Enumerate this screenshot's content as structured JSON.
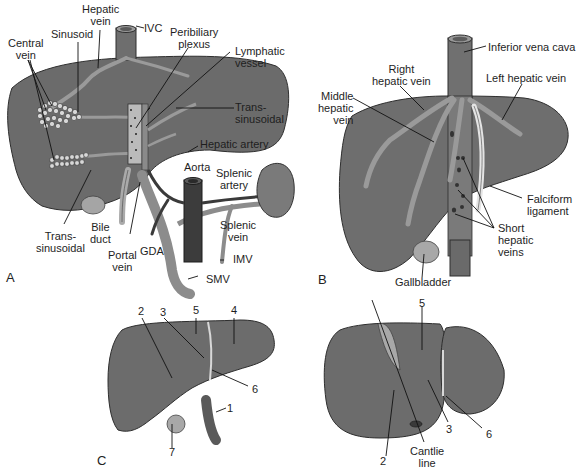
{
  "figure": {
    "panels": [
      {
        "id": "A",
        "letter": "A"
      },
      {
        "id": "B",
        "letter": "B"
      },
      {
        "id": "C",
        "letter": "C"
      }
    ],
    "colors": {
      "liver": "#6b6b6b",
      "liver_dark": "#4a4a4a",
      "vessel_light": "#9a9a9a",
      "vessel_dark": "#3a3a3a",
      "gallbladder": "#a8a8a8",
      "ligament": "#e4e4e4",
      "leader_line": "#111111",
      "background": "#ffffff"
    }
  },
  "panel_a": {
    "labels": {
      "hepatic_vein": "Hepatic\nvein",
      "ivc": "IVC",
      "sinusoid": "Sinusoid",
      "central_vein": "Central\nvein",
      "peribiliary_plexus": "Peribiliary\nplexus",
      "lymphatic_vessel": "Lymphatic\nvessel",
      "trans_sinusoidal_right": "Trans-\nsinusoidal",
      "hepatic_artery": "Hepatic artery",
      "aorta": "Aorta",
      "splenic_artery": "Splenic\nartery",
      "splenic_vein": "Splenic\nvein",
      "bile_duct": "Bile\nduct",
      "trans_sinusoidal_left": "Trans-\nsinusoidal",
      "portal_vein": "Portal\nvein",
      "gda": "GDA",
      "imv": "IMV",
      "smv": "SMV"
    }
  },
  "panel_b": {
    "labels": {
      "inferior_vena_cava": "Inferior vena cava",
      "right_hepatic_vein": "Right\nhepatic vein",
      "left_hepatic_vein": "Left hepatic vein",
      "middle_hepatic_vein": "Middle\nhepatic\nvein",
      "falciform_ligament": "Falciform\nligament",
      "short_hepatic_veins": "Short\nhepatic\nveins",
      "gallbladder": "Gallbladder"
    }
  },
  "panel_c": {
    "left_view_numbers": [
      "2",
      "3",
      "5",
      "4",
      "6",
      "1",
      "7"
    ],
    "right_view_numbers": [
      "5",
      "2",
      "3",
      "6"
    ],
    "labels": {
      "cantlie_line": "Cantlie\nline"
    }
  }
}
